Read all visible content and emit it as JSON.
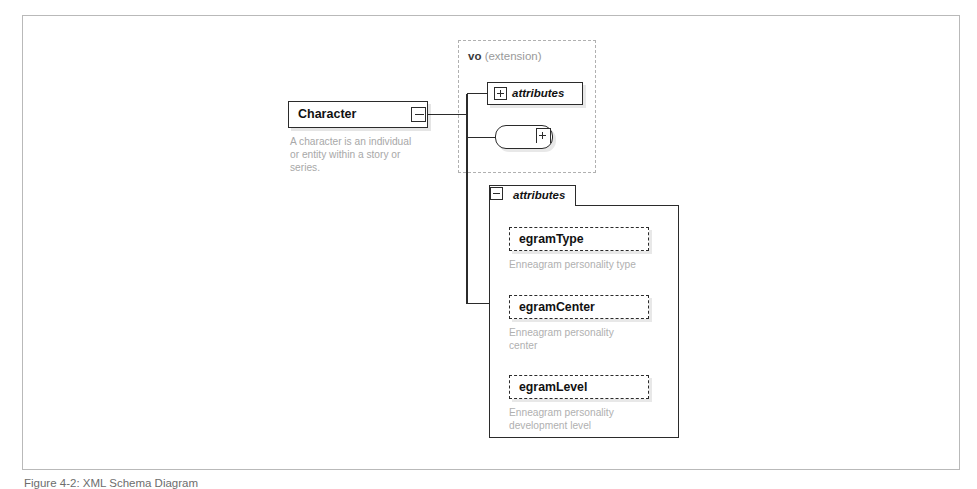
{
  "figure": {
    "caption": "Figure 4-2: XML Schema Diagram"
  },
  "diagram": {
    "type": "xml-schema-diagram",
    "root_element": {
      "name": "Character",
      "description": "A character is an individual\nor entity within a story or\nseries.",
      "toggle": "minus"
    },
    "extension_group": {
      "name": "vo",
      "kind": "(extension)"
    },
    "collapsed_attributes_node": {
      "label": "attributes",
      "toggle": "plus"
    },
    "sequence_node": {
      "icon": "sequence-compositor-icon",
      "toggle": "plus"
    },
    "attributes_panel": {
      "label": "attributes",
      "toggle": "minus",
      "attributes": [
        {
          "name": "egramType",
          "description": "Enneagram personality type"
        },
        {
          "name": "egramCenter",
          "description": "Enneagram personality\ncenter"
        },
        {
          "name": "egramLevel",
          "description": "Enneagram personality\ndevelopment level"
        }
      ]
    }
  },
  "colors": {
    "frame_border": "#b9b9b9",
    "node_border": "#2b2b2b",
    "description_text": "#a8a8a8",
    "group_dash": "#b0b0b0",
    "connector": "#2b2b2b",
    "caption_text": "#6d6d6d"
  }
}
